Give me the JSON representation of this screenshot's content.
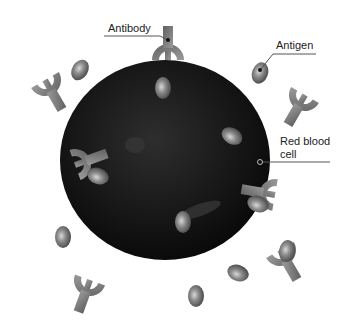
{
  "labels": {
    "antibody": "Antibody",
    "antigen": "Antigen",
    "red_blood_cell_line1": "Red blood",
    "red_blood_cell_line2": "cell"
  },
  "colors": {
    "background": "#ffffff",
    "cell": "#1a1a1a",
    "antibody": "#7a7a7a",
    "antigen": "#6e6e6e",
    "leader_line": "#555555"
  }
}
